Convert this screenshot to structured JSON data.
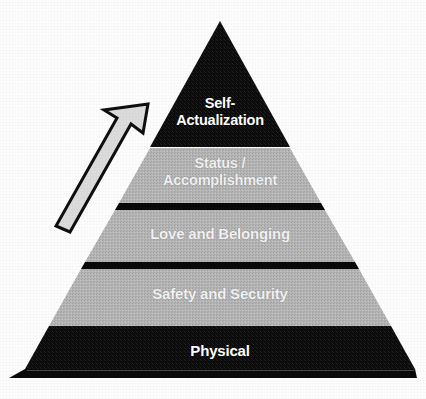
{
  "diagram": {
    "type": "pyramid",
    "background_color": "#fdfdfd",
    "tier_dark_color": "#0d0d0d",
    "tier_light_color": "#b2b2b2",
    "label_color": "#ffffff",
    "separator_color": "#0a0a0a",
    "tiers": [
      {
        "index": 0,
        "label": "Self-\nActualization",
        "fill": "dark",
        "fill_color": "#0d0d0d",
        "text_color": "#ffffff"
      },
      {
        "index": 1,
        "label": "Status /\nAccomplishment",
        "fill": "light",
        "fill_color": "#b2b2b2",
        "text_color": "#f2f2f2"
      },
      {
        "index": 2,
        "label": "Love and Belonging",
        "fill": "light",
        "fill_color": "#b2b2b2",
        "text_color": "#f4f4f4"
      },
      {
        "index": 3,
        "label": "Safety and Security",
        "fill": "light",
        "fill_color": "#b2b2b2",
        "text_color": "#f4f4f4"
      },
      {
        "index": 4,
        "label": "Physical",
        "fill": "dark",
        "fill_color": "#0d0d0d",
        "text_color": "#ffffff"
      }
    ],
    "arrow": {
      "name": "upward-progress-arrow",
      "direction": "up-right",
      "fill_color": "#d8d8d8",
      "outline_color": "#101010",
      "label": ""
    }
  }
}
